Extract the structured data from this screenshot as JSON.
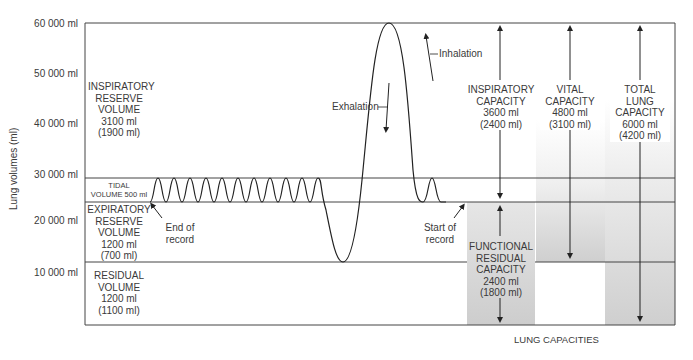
{
  "chart": {
    "y_axis_title": "Lung volumes (ml)",
    "y_ticks": [
      "60 000 ml",
      "50 000 ml",
      "40 000 ml",
      "30 000 ml",
      "20 000 ml",
      "10 000 ml"
    ],
    "footer_label": "LUNG CAPACITIES"
  },
  "volumes": {
    "irv": {
      "lines": [
        "INSPIRATORY",
        "RESERVE",
        "VOLUME",
        "3100 ml",
        "(1900 ml)"
      ]
    },
    "tidal": {
      "lines": [
        "TIDAL",
        "VOLUME 500 ml"
      ]
    },
    "erv": {
      "lines": [
        "EXPIRATORY",
        "RESERVE",
        "VOLUME",
        "1200 ml",
        "(700 ml)"
      ]
    },
    "rv": {
      "lines": [
        "RESIDUAL",
        "VOLUME",
        "1200 ml",
        "(1100 ml)"
      ]
    }
  },
  "annotations": {
    "end_of_record": [
      "End of",
      "record"
    ],
    "start_of_record": [
      "Start of",
      "record"
    ],
    "exhalation": "Exhalation",
    "inhalation": "Inhalation"
  },
  "capacities": {
    "ic": {
      "lines": [
        "INSPIRATORY",
        "CAPACITY",
        "3600 ml",
        "(2400 ml)"
      ]
    },
    "vc": {
      "lines": [
        "VITAL",
        "CAPACITY",
        "4800 ml",
        "(3100 ml)"
      ]
    },
    "tlc": {
      "lines": [
        "TOTAL",
        "LUNG",
        "CAPACITY",
        "6000 ml",
        "(4200 ml)"
      ]
    },
    "frc": {
      "lines": [
        "FUNCTIONAL",
        "RESIDUAL",
        "CAPACITY",
        "2400 ml",
        "(1800 ml)"
      ]
    }
  },
  "colors": {
    "line": "#333333",
    "shade": "#d4d4d4",
    "background": "#ffffff"
  }
}
